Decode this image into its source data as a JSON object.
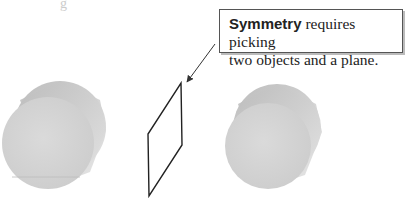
{
  "callout": {
    "keyword": "Symmetry",
    "line1_rest": " requires picking",
    "line2": "two objects and a plane."
  },
  "top_fragment": "g",
  "objects": [
    {
      "name": "left-cylinder",
      "type": "cylinder"
    },
    {
      "name": "mirror-plane",
      "type": "plane"
    },
    {
      "name": "right-cylinder",
      "type": "cylinder"
    }
  ],
  "colors": {
    "cylinder_face": "#d6d6d6",
    "cylinder_body": "#c4c4c4",
    "plane_stroke": "#222222",
    "callout_border": "#555555"
  }
}
